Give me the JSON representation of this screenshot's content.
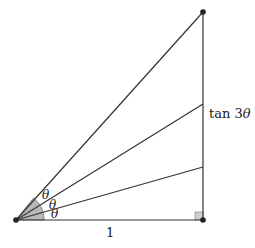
{
  "diagram": {
    "labels": {
      "theta1": "θ",
      "theta2": "θ",
      "theta3": "θ",
      "base": "1",
      "opposite_prefix": "tan 3",
      "opposite_var": "θ"
    },
    "points": {
      "origin": [
        16,
        220
      ],
      "right_angle": [
        203,
        220
      ],
      "top": [
        203,
        12
      ]
    },
    "ray_intersections_on_vertical": [
      167,
      104
    ],
    "colors": {
      "line": "#333333",
      "sector": "#b8b8b8",
      "right_angle_fill": "#cfcfcf"
    }
  }
}
